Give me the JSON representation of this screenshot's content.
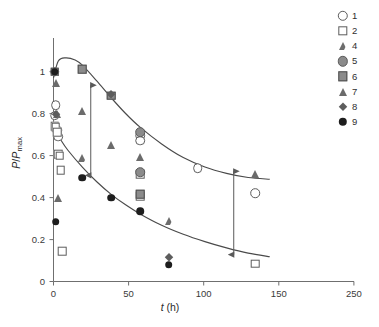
{
  "chart_data": {
    "type": "scatter",
    "title": "",
    "xlabel": "t (h)",
    "ylabel": "P/Pmax",
    "xlabel_parts": {
      "var": "t",
      "unit": "(h)"
    },
    "ylabel_parts": {
      "num": "P",
      "den": "P",
      "sub": "max"
    },
    "xlim": [
      0,
      250
    ],
    "ylim": [
      0,
      1.18
    ],
    "xticks": [
      0,
      50,
      100,
      150,
      250
    ],
    "xticklabels": [
      "0",
      "50",
      "100",
      "150",
      "250"
    ],
    "yticks": [
      0,
      0.2,
      0.4,
      0.6,
      0.8,
      1
    ],
    "yticklabels": [
      "0",
      "0.2",
      "0.4",
      "0.6",
      "0.8",
      "1"
    ],
    "grid": false,
    "legend_position": "right-outside",
    "legend_title": "",
    "series": [
      {
        "name": "1",
        "marker": "open-circle",
        "points": [
          [
            1,
            0.79
          ],
          [
            2,
            0.84
          ],
          [
            3,
            0.72
          ],
          [
            4,
            0.69
          ],
          [
            72,
            0.695
          ],
          [
            72,
            0.67
          ],
          [
            120,
            0.54
          ],
          [
            168,
            0.42
          ]
        ]
      },
      {
        "name": "2",
        "marker": "open-square",
        "points": [
          [
            1,
            0.74
          ],
          [
            2,
            0.735
          ],
          [
            3,
            0.71
          ],
          [
            4,
            0.605
          ],
          [
            5,
            0.6
          ],
          [
            6,
            0.53
          ],
          [
            7,
            0.145
          ],
          [
            72,
            0.51
          ],
          [
            72,
            0.405
          ],
          [
            168,
            0.085
          ]
        ]
      },
      {
        "name": "4",
        "marker": "open-triangle",
        "points": [
          [
            24,
            0.59
          ],
          [
            96,
            0.29
          ]
        ]
      },
      {
        "name": "5",
        "marker": "gray-circle",
        "points": [
          [
            1,
            1.0
          ],
          [
            72,
            0.71
          ],
          [
            72,
            0.52
          ]
        ]
      },
      {
        "name": "6",
        "marker": "gray-square",
        "points": [
          [
            1,
            1.0
          ],
          [
            24,
            1.01
          ],
          [
            48,
            0.885
          ],
          [
            72,
            0.415
          ]
        ]
      },
      {
        "name": "7",
        "marker": "filled-triangle",
        "points": [
          [
            1,
            1.0
          ],
          [
            2,
            0.945
          ],
          [
            3,
            0.8
          ],
          [
            4,
            0.4
          ],
          [
            24,
            0.81
          ],
          [
            48,
            0.65
          ],
          [
            72,
            0.595
          ],
          [
            168,
            0.51
          ]
        ]
      },
      {
        "name": "8",
        "marker": "filled-diamond",
        "points": [
          [
            1,
            1.0
          ],
          [
            2,
            0.8
          ],
          [
            48,
            0.895
          ],
          [
            96,
            0.115
          ]
        ]
      },
      {
        "name": "9",
        "marker": "black-circle",
        "points": [
          [
            1,
            1.0
          ],
          [
            2,
            0.285
          ],
          [
            24,
            0.495
          ],
          [
            48,
            0.4
          ],
          [
            72,
            0.335
          ],
          [
            96,
            0.08
          ]
        ]
      }
    ],
    "fitted_curves": [
      {
        "name": "upper-decay-curve",
        "points": [
          [
            0,
            0.97
          ],
          [
            4,
            1.05
          ],
          [
            10,
            1.065
          ],
          [
            18,
            1.055
          ],
          [
            24,
            1.03
          ],
          [
            36,
            0.955
          ],
          [
            48,
            0.875
          ],
          [
            60,
            0.8
          ],
          [
            72,
            0.735
          ],
          [
            90,
            0.655
          ],
          [
            108,
            0.59
          ],
          [
            126,
            0.545
          ],
          [
            144,
            0.515
          ],
          [
            162,
            0.495
          ],
          [
            180,
            0.487
          ]
        ]
      },
      {
        "name": "lower-decay-curve",
        "points": [
          [
            0,
            0.735
          ],
          [
            6,
            0.675
          ],
          [
            12,
            0.625
          ],
          [
            24,
            0.545
          ],
          [
            36,
            0.475
          ],
          [
            48,
            0.415
          ],
          [
            60,
            0.365
          ],
          [
            72,
            0.322
          ],
          [
            90,
            0.268
          ],
          [
            108,
            0.225
          ],
          [
            126,
            0.19
          ],
          [
            144,
            0.16
          ],
          [
            162,
            0.135
          ],
          [
            180,
            0.118
          ]
        ]
      }
    ],
    "annotations": [
      {
        "name": "left-gap-arrow",
        "type": "double-headed-arrow",
        "x": 31,
        "y_top": 0.935,
        "y_bottom": 0.505
      },
      {
        "name": "right-gap-arrow",
        "type": "double-headed-arrow",
        "x": 150,
        "y_top": 0.525,
        "y_bottom": 0.128
      }
    ]
  },
  "legend": {
    "items": [
      {
        "label": "1",
        "marker": "open-circle"
      },
      {
        "label": "2",
        "marker": "open-square"
      },
      {
        "label": "4",
        "marker": "open-triangle"
      },
      {
        "label": "5",
        "marker": "gray-circle"
      },
      {
        "label": "6",
        "marker": "gray-square"
      },
      {
        "label": "7",
        "marker": "filled-triangle"
      },
      {
        "label": "8",
        "marker": "filled-diamond"
      },
      {
        "label": "9",
        "marker": "black-circle"
      }
    ]
  },
  "colors": {
    "axis": "#6f6f6f",
    "curve": "#4a4a4a",
    "open_marker_edge": "#5c5c5c",
    "gray_fill": "#8b8b8b",
    "dark_fill": "#6b6b6b",
    "black_fill": "#1d1d1d",
    "background": "#ffffff"
  }
}
